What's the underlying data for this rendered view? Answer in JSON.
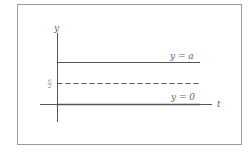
{
  "diagram": {
    "axes": {
      "vertical_label": "y",
      "horizontal_label": "t"
    },
    "lines": [
      {
        "label": "y = a",
        "style": "solid"
      },
      {
        "label": "a/2",
        "style": "dashed",
        "label_numerator": "a",
        "label_denominator": "2"
      },
      {
        "label": "y = 0",
        "style": "solid"
      }
    ],
    "colors": {
      "line": "#555555",
      "text": "#666666",
      "frame": "#9a9a9a"
    }
  }
}
